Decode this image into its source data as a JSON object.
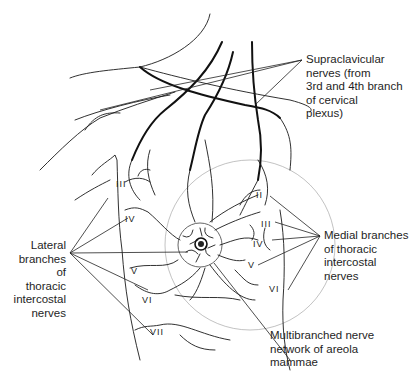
{
  "labels": {
    "supraclavicular": "Supraclavicular\nnerves (from\n3rd and 4th branch\nof cervical\nplexus)",
    "lateral": "Lateral\nbranches of\nthoracic\nintercostal\nnerves",
    "medial": "Medial branches\nof thoracic\nintercostal\nnerves",
    "areola": "Multibranched nerve\nnetwork of areola\nmammae"
  },
  "lateral_numerals": [
    "III",
    "IV",
    "V",
    "VI",
    "VII"
  ],
  "medial_numerals": [
    "II",
    "III",
    "IV",
    "V",
    "VI"
  ],
  "colors": {
    "line": "#1a1a1a",
    "text": "#1e1e1e",
    "contour": "#999999",
    "background": "#ffffff"
  }
}
